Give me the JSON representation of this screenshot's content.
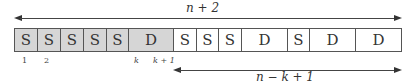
{
  "diagram": {
    "top_span": {
      "label": "n + 2",
      "from_x": 14,
      "to_x": 400
    },
    "bottom_span": {
      "label": "n − k + 1",
      "from_x": 173,
      "to_x": 400
    },
    "cells": [
      {
        "label": "S",
        "shaded": true,
        "width": 23
      },
      {
        "label": "S",
        "shaded": true,
        "width": 23
      },
      {
        "label": "S",
        "shaded": true,
        "width": 23
      },
      {
        "label": "S",
        "shaded": true,
        "width": 23
      },
      {
        "label": "S",
        "shaded": true,
        "width": 22
      },
      {
        "label": "D",
        "shaded": true,
        "width": 45
      },
      {
        "label": "S",
        "shaded": false,
        "width": 23
      },
      {
        "label": "S",
        "shaded": false,
        "width": 22
      },
      {
        "label": "S",
        "shaded": false,
        "width": 23
      },
      {
        "label": "D",
        "shaded": false,
        "width": 46
      },
      {
        "label": "S",
        "shaded": false,
        "width": 22
      },
      {
        "label": "D",
        "shaded": false,
        "width": 46
      },
      {
        "label": "D",
        "shaded": false,
        "width": 45
      }
    ],
    "indices": [
      {
        "label": "1",
        "x": 22
      },
      {
        "label": "2",
        "x": 44
      },
      {
        "label": "k",
        "x": 134
      },
      {
        "label": "k + 1",
        "x": 153
      }
    ],
    "colors": {
      "shaded": "#d6d6d6",
      "unshaded": "#ffffff",
      "stroke": "#555555"
    }
  }
}
